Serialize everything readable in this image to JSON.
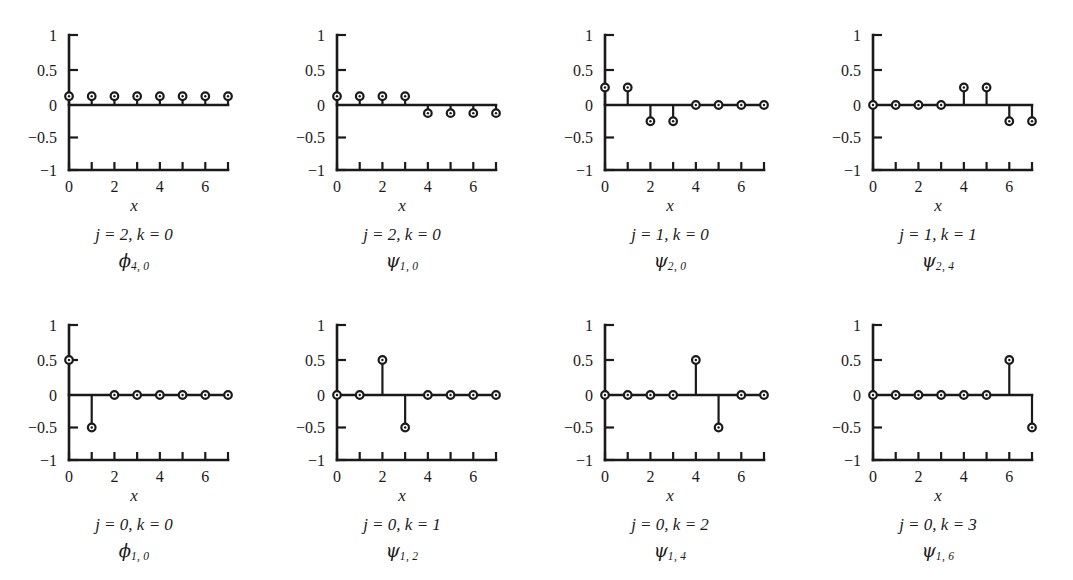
{
  "figure": {
    "background": "#ffffff",
    "ink_color": "#1a1a1a",
    "rows": 2,
    "columns": 4,
    "xlabel": "x"
  },
  "chart_data": [
    {
      "type": "scatter",
      "plot_style": "stem",
      "index": 0,
      "title": "",
      "caption_jk": "j = 2, k = 0",
      "caption_symbol": "ϕ",
      "caption_subscript": "4, 0",
      "xlabel": "x",
      "ylabel": "",
      "x": [
        0,
        1,
        2,
        3,
        4,
        5,
        6,
        7
      ],
      "values": [
        0.125,
        0.125,
        0.125,
        0.125,
        0.125,
        0.125,
        0.125,
        0.125
      ],
      "xlim": [
        0,
        7
      ],
      "ylim": [
        -1,
        1
      ],
      "yticks": [
        -1,
        -0.5,
        0,
        0.5,
        1
      ],
      "ytick_labels": [
        "−1",
        "−0.5",
        "0",
        "0.5",
        "1"
      ],
      "xticks": [
        0,
        1,
        2,
        3,
        4,
        5,
        6,
        7
      ],
      "xtick_labels": [
        "0",
        "",
        "2",
        "",
        "4",
        "",
        "6",
        ""
      ],
      "grid": false,
      "legend": "none"
    },
    {
      "type": "scatter",
      "plot_style": "stem",
      "index": 1,
      "title": "",
      "caption_jk": "j = 2, k = 0",
      "caption_symbol": "ψ",
      "caption_subscript": "1, 0",
      "xlabel": "x",
      "ylabel": "",
      "x": [
        0,
        1,
        2,
        3,
        4,
        5,
        6,
        7
      ],
      "values": [
        0.125,
        0.125,
        0.125,
        0.125,
        -0.125,
        -0.125,
        -0.125,
        -0.125
      ],
      "xlim": [
        0,
        7
      ],
      "ylim": [
        -1,
        1
      ],
      "yticks": [
        -1,
        -0.5,
        0,
        0.5,
        1
      ],
      "ytick_labels": [
        "−1",
        "−0.5",
        "0",
        "0.5",
        "1"
      ],
      "xticks": [
        0,
        1,
        2,
        3,
        4,
        5,
        6,
        7
      ],
      "xtick_labels": [
        "0",
        "",
        "2",
        "",
        "4",
        "",
        "6",
        ""
      ],
      "grid": false,
      "legend": "none"
    },
    {
      "type": "scatter",
      "plot_style": "stem",
      "index": 2,
      "title": "",
      "caption_jk": "j = 1, k = 0",
      "caption_symbol": "ψ",
      "caption_subscript": "2, 0",
      "xlabel": "x",
      "ylabel": "",
      "x": [
        0,
        1,
        2,
        3,
        4,
        5,
        6,
        7
      ],
      "values": [
        0.25,
        0.25,
        -0.25,
        -0.25,
        0,
        0,
        0,
        0
      ],
      "xlim": [
        0,
        7
      ],
      "ylim": [
        -1,
        1
      ],
      "yticks": [
        -1,
        -0.5,
        0,
        0.5,
        1
      ],
      "ytick_labels": [
        "−1",
        "−0.5",
        "0",
        "0.5",
        "1"
      ],
      "xticks": [
        0,
        1,
        2,
        3,
        4,
        5,
        6,
        7
      ],
      "xtick_labels": [
        "0",
        "",
        "2",
        "",
        "4",
        "",
        "6",
        ""
      ],
      "grid": false,
      "legend": "none"
    },
    {
      "type": "scatter",
      "plot_style": "stem",
      "index": 3,
      "title": "",
      "caption_jk": "j = 1, k = 1",
      "caption_symbol": "ψ",
      "caption_subscript": "2, 4",
      "xlabel": "x",
      "ylabel": "",
      "x": [
        0,
        1,
        2,
        3,
        4,
        5,
        6,
        7
      ],
      "values": [
        0,
        0,
        0,
        0,
        0.25,
        0.25,
        -0.25,
        -0.25
      ],
      "xlim": [
        0,
        7
      ],
      "ylim": [
        -1,
        1
      ],
      "yticks": [
        -1,
        -0.5,
        0,
        0.5,
        1
      ],
      "ytick_labels": [
        "−1",
        "−0.5",
        "0",
        "0.5",
        "1"
      ],
      "xticks": [
        0,
        1,
        2,
        3,
        4,
        5,
        6,
        7
      ],
      "xtick_labels": [
        "0",
        "",
        "2",
        "",
        "4",
        "",
        "6",
        ""
      ],
      "grid": false,
      "legend": "none"
    },
    {
      "type": "scatter",
      "plot_style": "stem",
      "index": 4,
      "title": "",
      "caption_jk": "j = 0, k = 0",
      "caption_symbol": "ϕ",
      "caption_subscript": "1, 0",
      "xlabel": "x",
      "ylabel": "",
      "x": [
        0,
        1,
        2,
        3,
        4,
        5,
        6,
        7
      ],
      "values": [
        0.5,
        -0.5,
        0,
        0,
        0,
        0,
        0,
        0
      ],
      "xlim": [
        0,
        7
      ],
      "ylim": [
        -1,
        1
      ],
      "yticks": [
        -1,
        -0.5,
        0,
        0.5,
        1
      ],
      "ytick_labels": [
        "−1",
        "−0.5",
        "0",
        "0.5",
        "1"
      ],
      "xticks": [
        0,
        1,
        2,
        3,
        4,
        5,
        6,
        7
      ],
      "xtick_labels": [
        "0",
        "",
        "2",
        "",
        "4",
        "",
        "6",
        ""
      ],
      "grid": false,
      "legend": "none"
    },
    {
      "type": "scatter",
      "plot_style": "stem",
      "index": 5,
      "title": "",
      "caption_jk": "j = 0, k = 1",
      "caption_symbol": "ψ",
      "caption_subscript": "1, 2",
      "xlabel": "x",
      "ylabel": "",
      "x": [
        0,
        1,
        2,
        3,
        4,
        5,
        6,
        7
      ],
      "values": [
        0,
        0,
        0.5,
        -0.5,
        0,
        0,
        0,
        0
      ],
      "xlim": [
        0,
        7
      ],
      "ylim": [
        -1,
        1
      ],
      "yticks": [
        -1,
        -0.5,
        0,
        0.5,
        1
      ],
      "ytick_labels": [
        "−1",
        "−0.5",
        "0",
        "0.5",
        "1"
      ],
      "xticks": [
        0,
        1,
        2,
        3,
        4,
        5,
        6,
        7
      ],
      "xtick_labels": [
        "0",
        "",
        "2",
        "",
        "4",
        "",
        "6",
        ""
      ],
      "grid": false,
      "legend": "none"
    },
    {
      "type": "scatter",
      "plot_style": "stem",
      "index": 6,
      "title": "",
      "caption_jk": "j = 0, k = 2",
      "caption_symbol": "ψ",
      "caption_subscript": "1, 4",
      "xlabel": "x",
      "ylabel": "",
      "x": [
        0,
        1,
        2,
        3,
        4,
        5,
        6,
        7
      ],
      "values": [
        0,
        0,
        0,
        0,
        0.5,
        -0.5,
        0,
        0
      ],
      "xlim": [
        0,
        7
      ],
      "ylim": [
        -1,
        1
      ],
      "yticks": [
        -1,
        -0.5,
        0,
        0.5,
        1
      ],
      "ytick_labels": [
        "−1",
        "−0.5",
        "0",
        "0.5",
        "1"
      ],
      "xticks": [
        0,
        1,
        2,
        3,
        4,
        5,
        6,
        7
      ],
      "xtick_labels": [
        "0",
        "",
        "2",
        "",
        "4",
        "",
        "6",
        ""
      ],
      "grid": false,
      "legend": "none"
    },
    {
      "type": "scatter",
      "plot_style": "stem",
      "index": 7,
      "title": "",
      "caption_jk": "j = 0, k = 3",
      "caption_symbol": "ψ",
      "caption_subscript": "1, 6",
      "xlabel": "x",
      "ylabel": "",
      "x": [
        0,
        1,
        2,
        3,
        4,
        5,
        6,
        7
      ],
      "values": [
        0,
        0,
        0,
        0,
        0,
        0,
        0.5,
        -0.5
      ],
      "xlim": [
        0,
        7
      ],
      "ylim": [
        -1,
        1
      ],
      "yticks": [
        -1,
        -0.5,
        0,
        0.5,
        1
      ],
      "ytick_labels": [
        "−1",
        "−0.5",
        "0",
        "0.5",
        "1"
      ],
      "xticks": [
        0,
        1,
        2,
        3,
        4,
        5,
        6,
        7
      ],
      "xtick_labels": [
        "0",
        "",
        "2",
        "",
        "4",
        "",
        "6",
        ""
      ],
      "grid": false,
      "legend": "none"
    }
  ]
}
